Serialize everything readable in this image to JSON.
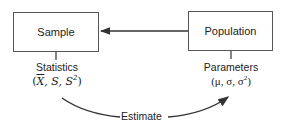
{
  "diagram": {
    "nodes": {
      "sample": {
        "label": "Sample"
      },
      "population": {
        "label": "Population"
      }
    },
    "statistics": {
      "label": "Statistics",
      "formula_open": "(",
      "xbar": "X",
      "sep1": ", S, S",
      "sup": "2",
      "formula_close": ")"
    },
    "parameters": {
      "label": "Parameters",
      "formula_prefix": "(μ, σ, σ",
      "sup": "2",
      "formula_close": ")"
    },
    "edges": [
      {
        "from": "population",
        "to": "sample",
        "label": ""
      },
      {
        "from": "statistics",
        "to": "parameters",
        "label": "Estimate"
      }
    ],
    "estimate_label": "Estimate",
    "colors": {
      "line": "#333333",
      "box_border": "#555555"
    }
  }
}
